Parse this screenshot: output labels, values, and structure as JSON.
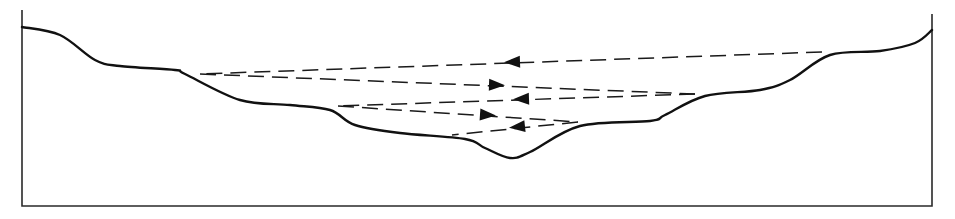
{
  "diagram": {
    "type": "cross-section profile with reflected ray paths",
    "colors": {
      "background": "#ffffff",
      "line": "#111111"
    },
    "frame": {
      "left_x": 22,
      "right_x": 932,
      "bottom_y": 206,
      "left_top_y": 10,
      "right_top_y": 14
    },
    "terrain_profile": [
      [
        22,
        27
      ],
      [
        60,
        35
      ],
      [
        95,
        60
      ],
      [
        120,
        66
      ],
      [
        175,
        70
      ],
      [
        185,
        74
      ],
      [
        240,
        100
      ],
      [
        290,
        105
      ],
      [
        330,
        110
      ],
      [
        355,
        125
      ],
      [
        400,
        133
      ],
      [
        465,
        139
      ],
      [
        485,
        148
      ],
      [
        510,
        158
      ],
      [
        530,
        152
      ],
      [
        580,
        126
      ],
      [
        650,
        121
      ],
      [
        665,
        115
      ],
      [
        705,
        96
      ],
      [
        760,
        90
      ],
      [
        790,
        80
      ],
      [
        830,
        55
      ],
      [
        880,
        51
      ],
      [
        915,
        43
      ],
      [
        932,
        30
      ]
    ],
    "rays": [
      {
        "from": [
          822,
          52
        ],
        "to": [
          200,
          74
        ],
        "arrow_at": [
          512,
          62
        ],
        "direction": "left"
      },
      {
        "from": [
          200,
          74
        ],
        "to": [
          695,
          94
        ],
        "arrow_at": [
          497,
          85
        ],
        "direction": "right"
      },
      {
        "from": [
          695,
          94
        ],
        "to": [
          338,
          106
        ],
        "arrow_at": [
          521,
          99
        ],
        "direction": "left"
      },
      {
        "from": [
          338,
          106
        ],
        "to": [
          578,
          122
        ],
        "arrow_at": [
          488,
          115
        ],
        "direction": "right"
      },
      {
        "from": [
          578,
          122
        ],
        "to": [
          452,
          135
        ],
        "arrow_at": [
          517,
          127
        ],
        "direction": "left"
      }
    ]
  }
}
